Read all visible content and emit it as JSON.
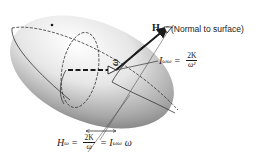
{
  "figure": {
    "colors": {
      "ink": "#1a1a1a",
      "ellipsoid_light": "#f4f4f4",
      "ellipsoid_dark": "#8a8a8a"
    }
  },
  "labels": {
    "H": "H",
    "normal": "(Normal to surface)",
    "omega": "ω"
  },
  "equation_top": {
    "lhs_symbol": "I",
    "lhs_sub": "ωω",
    "equals": "=",
    "frac_num": "2K",
    "frac_den": "ω²"
  },
  "equation_bottom": {
    "lhs_symbol": "H",
    "lhs_sub": "ω",
    "equals1": "=",
    "frac_num": "2K",
    "frac_den": "ω",
    "equals2": "=",
    "rhs_symbol": "I",
    "rhs_sub": "ωω",
    "rhs_tail": "ω"
  }
}
